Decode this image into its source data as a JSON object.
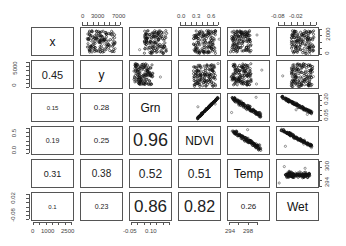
{
  "chart_data": {
    "type": "scatter",
    "title": "",
    "subtitle": "Pairs scatterplot matrix (lower panel: correlation coefficients, upper panel: scatterplots)",
    "variables": [
      "x",
      "y",
      "Grn",
      "NDVI",
      "Temp",
      "Wet"
    ],
    "correlations": [
      {
        "row": "y",
        "col": "x",
        "value": 0.45
      },
      {
        "row": "Grn",
        "col": "x",
        "value": 0.15
      },
      {
        "row": "Grn",
        "col": "y",
        "value": 0.28
      },
      {
        "row": "NDVI",
        "col": "x",
        "value": 0.19
      },
      {
        "row": "NDVI",
        "col": "y",
        "value": 0.25
      },
      {
        "row": "NDVI",
        "col": "Grn",
        "value": 0.96
      },
      {
        "row": "Temp",
        "col": "x",
        "value": 0.31
      },
      {
        "row": "Temp",
        "col": "y",
        "value": 0.38
      },
      {
        "row": "Temp",
        "col": "Grn",
        "value": 0.52
      },
      {
        "row": "Temp",
        "col": "NDVI",
        "value": 0.51
      },
      {
        "row": "Wet",
        "col": "x",
        "value": 0.1
      },
      {
        "row": "Wet",
        "col": "y",
        "value": 0.23
      },
      {
        "row": "Wet",
        "col": "Grn",
        "value": 0.86
      },
      {
        "row": "Wet",
        "col": "NDVI",
        "value": 0.82
      },
      {
        "row": "Wet",
        "col": "Temp",
        "value": 0.26
      }
    ],
    "axis_ticks": {
      "top": [
        {
          "var": "y",
          "labels": [
            "0",
            "3000",
            "7000"
          ]
        },
        {
          "var": "NDVI",
          "labels": [
            "0.0",
            "0.3",
            "0.6"
          ]
        },
        {
          "var": "Wet",
          "labels": [
            "-0.08",
            "-0.02"
          ]
        }
      ],
      "bottom": [
        {
          "var": "x",
          "labels": [
            "0",
            "1000",
            "2500"
          ]
        },
        {
          "var": "Grn",
          "labels": [
            "-0.05",
            "0.10"
          ]
        },
        {
          "var": "Temp",
          "labels": [
            "294",
            "298"
          ]
        }
      ],
      "left": [
        {
          "var": "y",
          "labels": [
            "0",
            "5000"
          ]
        },
        {
          "var": "NDVI",
          "labels": [
            "0.0",
            "0.5"
          ]
        },
        {
          "var": "Wet",
          "labels": [
            "-0.08",
            "0.02"
          ]
        }
      ],
      "right": [
        {
          "var": "x",
          "labels": [
            "0",
            "2000"
          ]
        },
        {
          "var": "Grn",
          "labels": [
            "0.05",
            "0.20"
          ]
        },
        {
          "var": "Temp",
          "labels": [
            "294",
            "300"
          ]
        }
      ]
    },
    "grid": false,
    "legend": "none"
  },
  "diag": [
    "x",
    "y",
    "Grn",
    "NDVI",
    "Temp",
    "Wet"
  ],
  "lower": {
    "r1c0": "0.45",
    "r2c0": "0.15",
    "r2c1": "0.28",
    "r3c0": "0.19",
    "r3c1": "0.25",
    "r3c2": "0.96",
    "r4c0": "0.31",
    "r4c1": "0.38",
    "r4c2": "0.52",
    "r4c3": "0.51",
    "r5c0": "0.1",
    "r5c1": "0.23",
    "r5c2": "0.86",
    "r5c3": "0.82",
    "r5c4": "0.26"
  },
  "ticks": {
    "top_y": [
      "0",
      "3000",
      "7000"
    ],
    "top_ndvi": [
      "0.0",
      "0.3",
      "0.6"
    ],
    "top_wet": [
      "-0.08",
      "-0.02"
    ],
    "bottom_x": [
      "0",
      "1000",
      "2500"
    ],
    "bottom_grn": [
      "-0.05",
      "0.10"
    ],
    "bottom_temp": [
      "294",
      "298"
    ],
    "left_y": [
      "0",
      "5000"
    ],
    "left_ndvi": [
      "0.0",
      "0.5"
    ],
    "left_wet": [
      "-0.08",
      "0.02"
    ],
    "right_x": [
      "0",
      "2000"
    ],
    "right_grn": [
      "0.05",
      "0.20"
    ],
    "right_temp": [
      "294",
      "300"
    ]
  }
}
